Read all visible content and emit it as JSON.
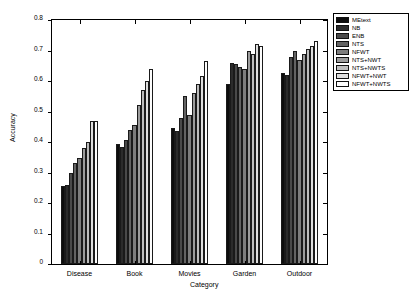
{
  "chart_data": {
    "type": "bar",
    "title": "",
    "xlabel": "Category",
    "ylabel": "Accuracy",
    "categories": [
      "Disease",
      "Book",
      "Movies",
      "Garden",
      "Outdoor"
    ],
    "ylim": [
      0,
      0.8
    ],
    "ytick_labels": [
      "0",
      "0.1",
      "0.2",
      "0.3",
      "0.4",
      "0.5",
      "0.6",
      "0.7",
      "0.8"
    ],
    "ytick_values": [
      0,
      0.1,
      0.2,
      0.3,
      0.4,
      0.5,
      0.6,
      0.7,
      0.8
    ],
    "grid": false,
    "legend_position": "upper right",
    "series": [
      {
        "name": "MEtext",
        "color": "#0d0d0d",
        "values": [
          0.255,
          0.395,
          0.445,
          0.59,
          0.625
        ]
      },
      {
        "name": "NB",
        "color": "#2b2b2b",
        "values": [
          0.258,
          0.385,
          0.435,
          0.66,
          0.62
        ]
      },
      {
        "name": "ENB",
        "color": "#4a4a4a",
        "values": [
          0.3,
          0.405,
          0.478,
          0.655,
          0.68
        ]
      },
      {
        "name": "NTS",
        "color": "#636363",
        "values": [
          0.33,
          0.44,
          0.55,
          0.645,
          0.7
        ]
      },
      {
        "name": "NFWT",
        "color": "#7d7d7d",
        "values": [
          0.348,
          0.455,
          0.49,
          0.64,
          0.67
        ]
      },
      {
        "name": "NTS+NWT",
        "color": "#9c9c9c",
        "values": [
          0.38,
          0.522,
          0.56,
          0.7,
          0.69
        ]
      },
      {
        "name": "NTS+NWTS",
        "color": "#bdbdbd",
        "values": [
          0.4,
          0.57,
          0.59,
          0.69,
          0.705
        ]
      },
      {
        "name": "NFWT+NWT",
        "color": "#dedede",
        "values": [
          0.468,
          0.6,
          0.618,
          0.72,
          0.715
        ]
      },
      {
        "name": "NFWT+NWTS",
        "color": "#fdfdfd",
        "values": [
          0.47,
          0.64,
          0.665,
          0.715,
          0.73
        ]
      }
    ]
  },
  "legend": {
    "items": [
      {
        "label": "MEtext"
      },
      {
        "label": "NB"
      },
      {
        "label": "ENB"
      },
      {
        "label": "NTS"
      },
      {
        "label": "NFWT"
      },
      {
        "label": "NTS+NWT"
      },
      {
        "label": "NTS+NWTS"
      },
      {
        "label": "NFWT+NWT"
      },
      {
        "label": "NFWT+NWTS"
      }
    ]
  }
}
